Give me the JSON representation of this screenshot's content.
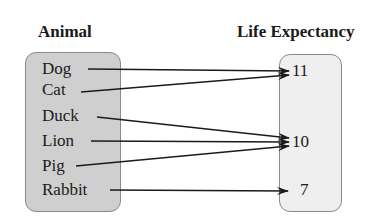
{
  "headers": {
    "domain": "Animal",
    "range": "Life Expectancy"
  },
  "colors": {
    "domain_box": "#cfcfcf",
    "range_box": "#efefef",
    "arrow": "#1a1a1a"
  },
  "domain": [
    {
      "label": "Dog",
      "y": 70
    },
    {
      "label": "Cat",
      "y": 90
    },
    {
      "label": "Duck",
      "y": 116
    },
    {
      "label": "Lion",
      "y": 142
    },
    {
      "label": "Pig",
      "y": 166
    },
    {
      "label": "Rabbit",
      "y": 190
    }
  ],
  "range": [
    {
      "label": "11",
      "y": 72
    },
    {
      "label": "10",
      "y": 142
    },
    {
      "label": "7",
      "y": 190
    }
  ],
  "mapping": [
    {
      "from": "Dog",
      "to": "11"
    },
    {
      "from": "Cat",
      "to": "11"
    },
    {
      "from": "Duck",
      "to": "10"
    },
    {
      "from": "Lion",
      "to": "10"
    },
    {
      "from": "Pig",
      "to": "10"
    },
    {
      "from": "Rabbit",
      "to": "7"
    }
  ]
}
